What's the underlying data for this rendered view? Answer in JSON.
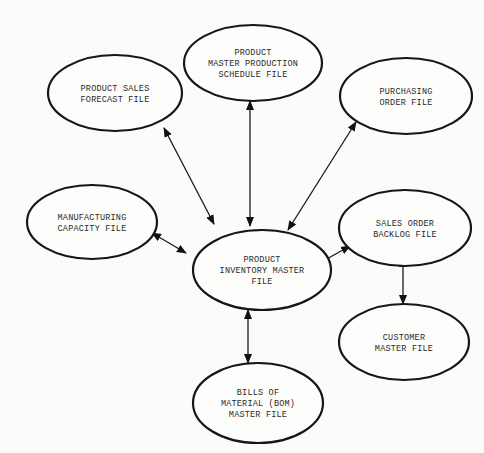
{
  "diagram": {
    "title": "",
    "nodes": [
      {
        "id": "sales-forecast",
        "lines": [
          "PRODUCT SALES",
          "FORECAST FILE"
        ],
        "cx": 115,
        "cy": 93,
        "rx": 67,
        "ry": 38
      },
      {
        "id": "mps",
        "lines": [
          "PRODUCT",
          "MASTER PRODUCTION",
          "SCHEDULE FILE"
        ],
        "cx": 253,
        "cy": 63,
        "rx": 69,
        "ry": 38
      },
      {
        "id": "purchasing",
        "lines": [
          "PURCHASING",
          "ORDER FILE"
        ],
        "cx": 406,
        "cy": 96,
        "rx": 66,
        "ry": 38
      },
      {
        "id": "mfg-capacity",
        "lines": [
          "MANUFACTURING",
          "CAPACITY FILE"
        ],
        "cx": 92,
        "cy": 222,
        "rx": 65,
        "ry": 37
      },
      {
        "id": "inventory",
        "lines": [
          "PRODUCT",
          "INVENTORY MASTER",
          "FILE"
        ],
        "cx": 262,
        "cy": 270,
        "rx": 69,
        "ry": 40
      },
      {
        "id": "sales-backlog",
        "lines": [
          "SALES ORDER",
          "BACKLOG FILE"
        ],
        "cx": 405,
        "cy": 228,
        "rx": 66,
        "ry": 38
      },
      {
        "id": "customer",
        "lines": [
          "CUSTOMER",
          "MASTER FILE"
        ],
        "cx": 404,
        "cy": 342,
        "rx": 65,
        "ry": 38
      },
      {
        "id": "bom",
        "lines": [
          "BILLS OF",
          "MATERIAL (BOM)",
          "MASTER FILE"
        ],
        "cx": 258,
        "cy": 403,
        "rx": 65,
        "ry": 40
      }
    ],
    "edges": [
      {
        "from": "inventory",
        "to": "sales-forecast",
        "x1": 214,
        "y1": 224,
        "x2": 164,
        "y2": 128,
        "bidirectional": true
      },
      {
        "from": "inventory",
        "to": "mps",
        "x1": 250,
        "y1": 226,
        "x2": 250,
        "y2": 101,
        "bidirectional": true
      },
      {
        "from": "inventory",
        "to": "purchasing",
        "x1": 288,
        "y1": 230,
        "x2": 356,
        "y2": 122,
        "bidirectional": true
      },
      {
        "from": "inventory",
        "to": "mfg-capacity",
        "x1": 186,
        "y1": 253,
        "x2": 152,
        "y2": 233,
        "bidirectional": true
      },
      {
        "from": "inventory",
        "to": "sales-backlog",
        "x1": 316,
        "y1": 265,
        "x2": 350,
        "y2": 246,
        "bidirectional": true
      },
      {
        "from": "inventory",
        "to": "bom",
        "x1": 248,
        "y1": 310,
        "x2": 248,
        "y2": 363,
        "bidirectional": true
      },
      {
        "from": "sales-backlog",
        "to": "customer",
        "x1": 403,
        "y1": 258,
        "x2": 403,
        "y2": 304,
        "bidirectional": true
      }
    ]
  }
}
